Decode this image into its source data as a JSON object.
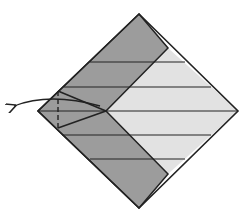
{
  "diagram": {
    "type": "origami-fold-step",
    "colors": {
      "background": "#ffffff",
      "dark_face": "#9c9c9c",
      "light_face": "#e2e2e2",
      "line": "#222222"
    },
    "shapes": {
      "outline": "139,14 238,111 139,208 38,111",
      "dark_band": "139,14 168,48 106,111 168,174 139,208 38,111",
      "light_region": "168,48 238,111 168,174 106,111"
    },
    "horizontal_creases": [
      {
        "x1": 90,
        "y1": 62,
        "x2": 185,
        "y2": 62
      },
      {
        "x1": 64,
        "y1": 87,
        "x2": 211,
        "y2": 87
      },
      {
        "x1": 38,
        "y1": 111,
        "x2": 238,
        "y2": 111
      },
      {
        "x1": 62,
        "y1": 135,
        "x2": 211,
        "y2": 135
      },
      {
        "x1": 90,
        "y1": 159,
        "x2": 185,
        "y2": 159
      }
    ],
    "fold_lines": [
      {
        "x1": 58,
        "y1": 91,
        "x2": 106,
        "y2": 111
      },
      {
        "x1": 58,
        "y1": 128,
        "x2": 106,
        "y2": 111
      }
    ],
    "valley_fold_dashed": {
      "x1": 58,
      "y1": 91,
      "x2": 58,
      "y2": 128
    },
    "arrow": {
      "path": "M 100 106 Q 50 92 14 106",
      "label": "fold flap to the left"
    }
  }
}
